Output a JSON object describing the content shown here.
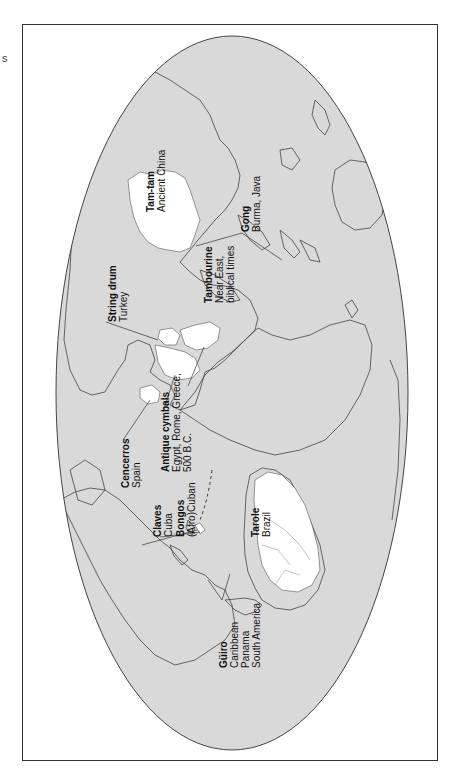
{
  "edge_text": "s",
  "map": {
    "projection": "world map rotated 90 degrees (north to the left)",
    "ocean_color": "#d9d9d9",
    "highlight_color": "#ffffff",
    "outline_color": "#333333",
    "frame_color": "#333333"
  },
  "labels": [
    {
      "id": "tam-tam",
      "name": "Tam-tam",
      "place": [
        "Ancient China"
      ]
    },
    {
      "id": "gong",
      "name": "Gong",
      "place": [
        "Burma, Java"
      ]
    },
    {
      "id": "tambourine",
      "name": "Tambourine",
      "place": [
        "Near East,",
        "biblical times"
      ]
    },
    {
      "id": "string-drum",
      "name": "String drum",
      "place": [
        "Turkey"
      ]
    },
    {
      "id": "cencerros",
      "name": "Cencerros",
      "place": [
        "Spain"
      ]
    },
    {
      "id": "antique-cymbals",
      "name": "Antique cymbals",
      "place": [
        "Egypt, Rome, Greece,",
        "500 B.C."
      ]
    },
    {
      "id": "claves",
      "name": "Claves",
      "place": [
        "Cuba"
      ]
    },
    {
      "id": "bongos",
      "name": "Bongos",
      "place": [
        "(Afro)Cuban"
      ]
    },
    {
      "id": "guiro",
      "name": "Güiro",
      "place": [
        "Caribbean",
        "Panama",
        "South America"
      ]
    },
    {
      "id": "tarole",
      "name": "Tarole",
      "place": [
        "Brazil"
      ]
    }
  ]
}
